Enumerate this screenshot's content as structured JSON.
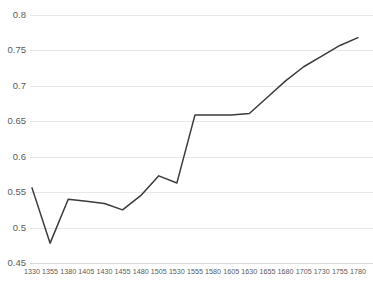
{
  "chart_data": {
    "type": "line",
    "title": "",
    "subtitle": "",
    "xlabel": "",
    "ylabel": "",
    "grid": true,
    "legend": false,
    "legend_position": "none",
    "line_color": "#3b3b3b",
    "grid_color": "#e8e8e8",
    "background_color": "#ffffff",
    "xlim": [
      1330,
      1780
    ],
    "ylim": [
      0.45,
      0.8
    ],
    "ytick_labels": [
      "0.8",
      "0.75",
      "0.7",
      "0.65",
      "0.6",
      "0.55",
      "0.5",
      "0.45"
    ],
    "ytick_values": [
      0.8,
      0.75,
      0.7,
      0.65,
      0.6,
      0.55,
      0.5,
      0.45
    ],
    "xtick_labels": [
      "1330",
      "1355",
      "1380",
      "1405",
      "1430",
      "1455",
      "1480",
      "1505",
      "1530",
      "1555",
      "1580",
      "1605",
      "1630",
      "1655",
      "1680",
      "1705",
      "1730",
      "1755",
      "1780"
    ],
    "x": [
      1330,
      1355,
      1380,
      1405,
      1430,
      1455,
      1480,
      1505,
      1530,
      1555,
      1580,
      1605,
      1630,
      1655,
      1680,
      1705,
      1730,
      1755,
      1780
    ],
    "values": [
      0.556,
      0.478,
      0.54,
      0.537,
      0.534,
      0.525,
      0.545,
      0.573,
      0.563,
      0.659,
      0.659,
      0.659,
      0.661,
      0.684,
      0.707,
      0.727,
      0.742,
      0.757,
      0.768
    ],
    "series": [
      {
        "name": "series-1",
        "values": [
          0.556,
          0.478,
          0.54,
          0.537,
          0.534,
          0.525,
          0.545,
          0.573,
          0.563,
          0.659,
          0.659,
          0.659,
          0.661,
          0.684,
          0.707,
          0.727,
          0.742,
          0.757,
          0.768
        ]
      }
    ]
  }
}
